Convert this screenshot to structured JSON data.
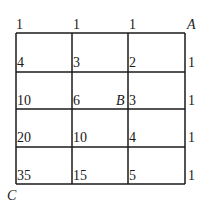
{
  "diagram": {
    "type": "grid-path-count",
    "grid": {
      "columns": 3,
      "rows": 4,
      "line_color": "#1a1a1a",
      "x_lines": [
        16,
        72,
        128,
        185
      ],
      "y_lines": [
        33,
        72,
        109,
        147,
        184
      ]
    },
    "points": {
      "A": "A",
      "B": "B",
      "C": "C"
    },
    "node_values": [
      [
        "1",
        "1",
        "1",
        ""
      ],
      [
        "4",
        "3",
        "2",
        "1"
      ],
      [
        "10",
        "6",
        "3",
        "1"
      ],
      [
        "20",
        "10",
        "4",
        "1"
      ],
      [
        "35",
        "15",
        "5",
        "1"
      ]
    ]
  }
}
